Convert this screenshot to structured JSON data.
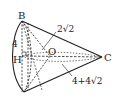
{
  "diagram": {
    "type": "cone-geometry",
    "points": {
      "B": "B",
      "H": "H",
      "O": "O",
      "C": "C"
    },
    "labels": {
      "height_BH": "4",
      "radius": "2√2",
      "slant": "4+4√2"
    },
    "colors": {
      "stroke": "#222222",
      "background": "#ffffff"
    }
  }
}
